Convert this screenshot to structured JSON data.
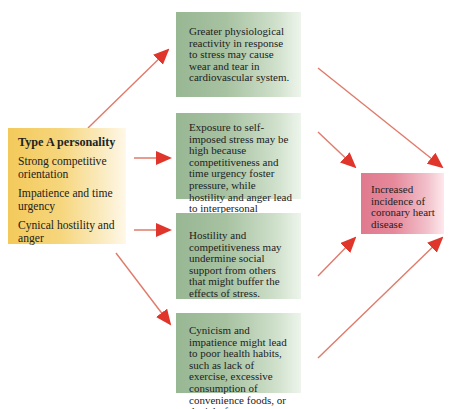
{
  "source": {
    "title": "Type A personality",
    "traits": [
      "Strong competitive orientation",
      "Impatience and time urgency",
      "Cynical hostility and anger"
    ]
  },
  "pathways": [
    "Greater physiological reactivity in response to stress may cause wear and tear in cardiovascular system.",
    "Exposure to self-imposed stress may be high because competitiveness and time urgency foster pressure, while hostility and anger lead to interpersonal difficulties.",
    "Hostility and competitiveness may undermine social support from others that might buffer the effects of stress.",
    "Cynicism and impatience might lead to poor health habits, such as lack of exercise, excessive consumption of convenience foods, or denial of symptoms."
  ],
  "outcome": {
    "label": "Increased incidence of coronary heart disease"
  },
  "colors": {
    "arrow": "#e0352b",
    "source_box": "#f3c95a",
    "pathway_box": "#98b793",
    "outcome_box": "#e07a8e"
  }
}
